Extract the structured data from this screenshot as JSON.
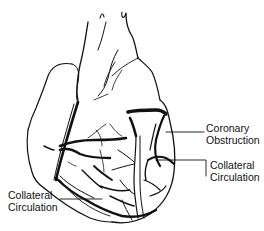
{
  "diagram": {
    "labels": [
      {
        "id": "coronary-obstruction",
        "lines": [
          "Coronary",
          "Obstruction"
        ]
      },
      {
        "id": "collateral-circulation-right",
        "lines": [
          "Collateral",
          "Circulation"
        ]
      },
      {
        "id": "collateral-circulation-left",
        "lines": [
          "Collateral",
          "Circulation"
        ]
      }
    ],
    "colors": {
      "ink": "#111111",
      "background": "#ffffff"
    }
  }
}
